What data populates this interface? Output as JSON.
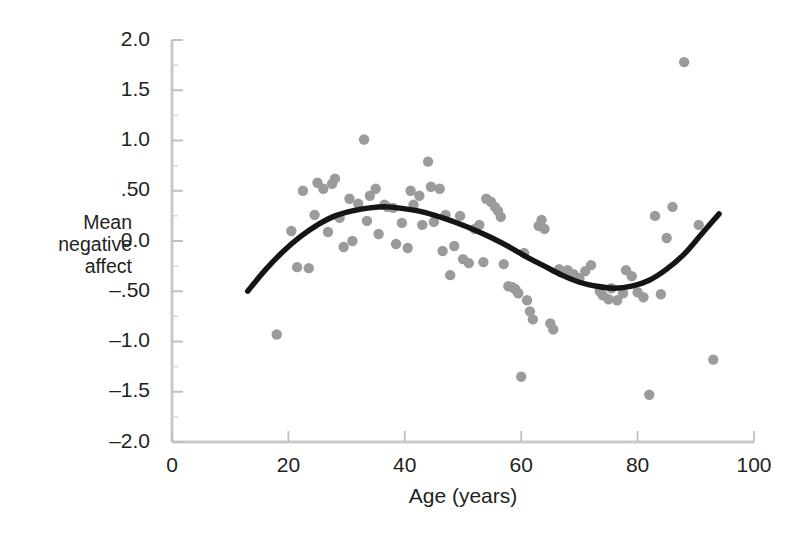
{
  "figure": {
    "background_color": "#ffffff",
    "dot_color": "#9b9b9b",
    "line_color": "#151515",
    "axis_color": "#c9c9c9"
  },
  "axes": {
    "y_axis_label_lines": [
      "Mean",
      "negative",
      "affect"
    ],
    "x_axis_title": "Age (years)",
    "y_tick_labels": [
      "2.0",
      "1.5",
      "1.0",
      ".50",
      "0.0",
      "–.50",
      "–1.0",
      "–1.5",
      "–2.0"
    ],
    "y_tick_values": [
      2.0,
      1.5,
      1.0,
      0.5,
      0.0,
      -0.5,
      -1.0,
      -1.5,
      -2.0
    ],
    "x_tick_labels": [
      "0",
      "20",
      "40",
      "60",
      "80",
      "100"
    ],
    "x_tick_values": [
      0,
      20,
      40,
      60,
      80,
      100
    ]
  },
  "chart_data": {
    "type": "scatter",
    "title": "",
    "subtitle": "",
    "xlabel": "Age (years)",
    "ylabel": "Mean negative affect",
    "xlim": [
      0,
      100
    ],
    "ylim": [
      -2.0,
      2.0
    ],
    "xticks": [
      0,
      20,
      40,
      60,
      80,
      100
    ],
    "yticks": [
      2.0,
      1.5,
      1.0,
      0.5,
      0.0,
      -0.5,
      -1.0,
      -1.5,
      -2.0
    ],
    "grid": false,
    "legend": false,
    "legend_position": "none",
    "annotations": [],
    "series": [
      {
        "name": "Participants",
        "type": "scatter",
        "marker": "circle",
        "color": "#9b9b9b",
        "marker_radius_px": 5.2,
        "points": [
          [
            18.0,
            -0.93
          ],
          [
            20.5,
            0.1
          ],
          [
            21.5,
            -0.26
          ],
          [
            22.5,
            0.5
          ],
          [
            23.5,
            -0.27
          ],
          [
            24.5,
            0.26
          ],
          [
            25.0,
            0.58
          ],
          [
            26.0,
            0.52
          ],
          [
            26.8,
            0.09
          ],
          [
            27.5,
            0.57
          ],
          [
            28.0,
            0.62
          ],
          [
            28.8,
            0.23
          ],
          [
            29.5,
            -0.06
          ],
          [
            30.5,
            0.42
          ],
          [
            31.0,
            0.0
          ],
          [
            32.0,
            0.37
          ],
          [
            33.0,
            1.01
          ],
          [
            33.5,
            0.2
          ],
          [
            34.0,
            0.45
          ],
          [
            35.0,
            0.52
          ],
          [
            35.5,
            0.07
          ],
          [
            36.5,
            0.36
          ],
          [
            37.0,
            0.34
          ],
          [
            38.0,
            0.33
          ],
          [
            38.5,
            -0.03
          ],
          [
            39.5,
            0.18
          ],
          [
            40.5,
            -0.07
          ],
          [
            41.0,
            0.5
          ],
          [
            41.5,
            0.36
          ],
          [
            42.5,
            0.45
          ],
          [
            43.0,
            0.16
          ],
          [
            44.0,
            0.79
          ],
          [
            44.5,
            0.54
          ],
          [
            45.0,
            0.19
          ],
          [
            46.0,
            0.52
          ],
          [
            46.5,
            -0.1
          ],
          [
            47.0,
            0.26
          ],
          [
            47.8,
            -0.34
          ],
          [
            48.5,
            -0.05
          ],
          [
            49.5,
            0.25
          ],
          [
            50.0,
            -0.18
          ],
          [
            51.0,
            -0.22
          ],
          [
            52.0,
            0.12
          ],
          [
            52.8,
            0.16
          ],
          [
            53.5,
            -0.21
          ],
          [
            54.0,
            0.42
          ],
          [
            54.8,
            0.39
          ],
          [
            55.5,
            0.34
          ],
          [
            56.0,
            0.3
          ],
          [
            56.5,
            0.24
          ],
          [
            57.0,
            -0.23
          ],
          [
            57.8,
            -0.45
          ],
          [
            58.5,
            -0.46
          ],
          [
            59.0,
            -0.48
          ],
          [
            59.5,
            -0.52
          ],
          [
            60.0,
            -1.35
          ],
          [
            60.5,
            -0.12
          ],
          [
            61.0,
            -0.59
          ],
          [
            61.5,
            -0.7
          ],
          [
            62.0,
            -0.78
          ],
          [
            63.0,
            0.15
          ],
          [
            63.5,
            0.21
          ],
          [
            64.0,
            0.12
          ],
          [
            65.0,
            -0.82
          ],
          [
            65.5,
            -0.88
          ],
          [
            66.5,
            -0.28
          ],
          [
            67.0,
            -0.31
          ],
          [
            68.0,
            -0.29
          ],
          [
            69.0,
            -0.33
          ],
          [
            70.0,
            -0.37
          ],
          [
            71.0,
            -0.3
          ],
          [
            72.0,
            -0.24
          ],
          [
            73.5,
            -0.5
          ],
          [
            74.0,
            -0.54
          ],
          [
            75.0,
            -0.58
          ],
          [
            75.5,
            -0.47
          ],
          [
            76.5,
            -0.59
          ],
          [
            77.5,
            -0.52
          ],
          [
            78.0,
            -0.29
          ],
          [
            79.0,
            -0.35
          ],
          [
            80.0,
            -0.51
          ],
          [
            81.0,
            -0.56
          ],
          [
            82.0,
            -1.53
          ],
          [
            83.0,
            0.25
          ],
          [
            84.0,
            -0.53
          ],
          [
            85.0,
            0.03
          ],
          [
            86.0,
            0.34
          ],
          [
            88.0,
            1.78
          ],
          [
            90.5,
            0.16
          ],
          [
            93.0,
            -1.18
          ]
        ]
      },
      {
        "name": "Cubic fit",
        "type": "line",
        "color": "#151515",
        "line_width_px": 5.4,
        "points": [
          [
            13.0,
            -0.5
          ],
          [
            16.0,
            -0.29
          ],
          [
            19.0,
            -0.11
          ],
          [
            22.0,
            0.04
          ],
          [
            25.0,
            0.16
          ],
          [
            28.0,
            0.25
          ],
          [
            31.0,
            0.3
          ],
          [
            34.0,
            0.33
          ],
          [
            37.0,
            0.34
          ],
          [
            40.0,
            0.32
          ],
          [
            43.0,
            0.29
          ],
          [
            46.0,
            0.24
          ],
          [
            49.0,
            0.18
          ],
          [
            52.0,
            0.11
          ],
          [
            55.0,
            0.03
          ],
          [
            58.0,
            -0.06
          ],
          [
            61.0,
            -0.16
          ],
          [
            64.0,
            -0.25
          ],
          [
            67.0,
            -0.34
          ],
          [
            70.0,
            -0.41
          ],
          [
            73.0,
            -0.45
          ],
          [
            76.0,
            -0.47
          ],
          [
            79.0,
            -0.45
          ],
          [
            82.0,
            -0.39
          ],
          [
            85.0,
            -0.28
          ],
          [
            88.0,
            -0.13
          ],
          [
            91.0,
            0.07
          ],
          [
            94.0,
            0.27
          ]
        ]
      }
    ]
  }
}
